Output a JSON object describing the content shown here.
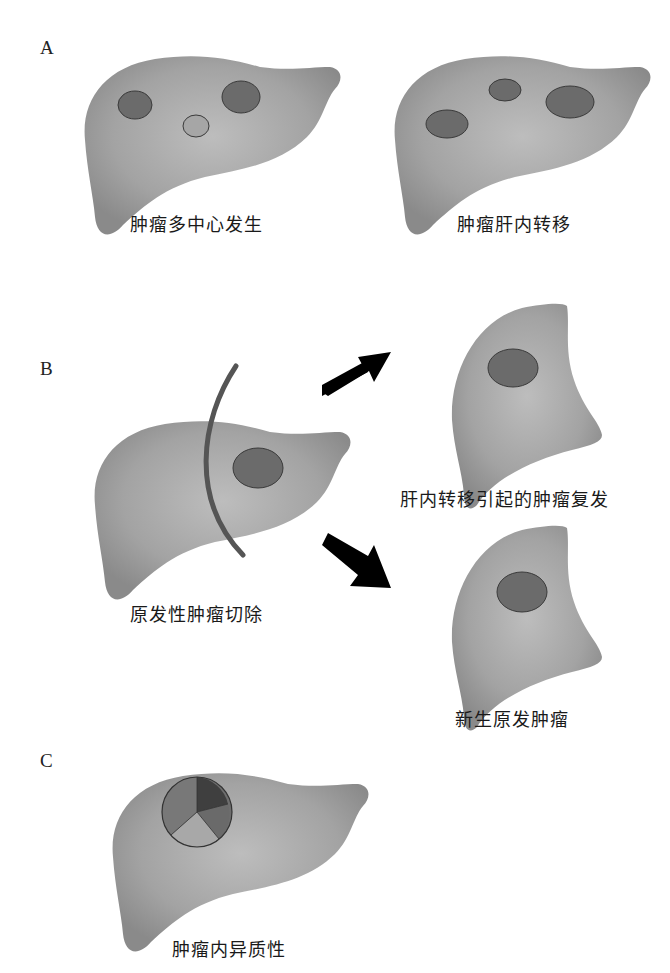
{
  "figure": {
    "panels": [
      {
        "id": "A",
        "label": "A",
        "items": [
          {
            "caption": "肿瘤多中心发生",
            "tumors": 3,
            "description": "liver with three separate nodules, one lighter"
          },
          {
            "caption": "肿瘤肝内转移",
            "tumors": 3,
            "description": "liver with three dark nodules"
          }
        ]
      },
      {
        "id": "B",
        "label": "B",
        "items": [
          {
            "caption": "原发性肿瘤切除",
            "description": "liver with one tumor and resection line"
          },
          {
            "caption": "肝内转移引起的肿瘤复发",
            "description": "remnant liver with recurrent tumor"
          },
          {
            "caption": "新生原发肿瘤",
            "description": "remnant liver with new primary tumor"
          }
        ]
      },
      {
        "id": "C",
        "label": "C",
        "items": [
          {
            "caption": "肿瘤内异质性",
            "description": "liver with tumor divided into heterogeneous sectors"
          }
        ]
      }
    ]
  },
  "colors": {
    "liver_fill": "#9a9a9a",
    "liver_highlight": "#b8b8b8",
    "tumor_dark": "#6b6b6b",
    "tumor_light": "#a6a6a6",
    "outline": "#3a3a3a",
    "resection_line": "#555555",
    "arrow": "#000000"
  }
}
